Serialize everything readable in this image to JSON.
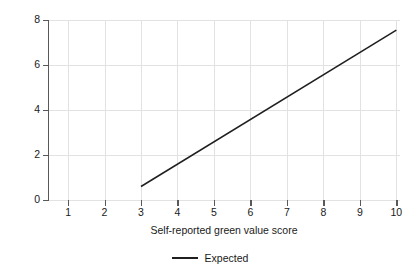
{
  "chart_data": {
    "type": "line",
    "title": "",
    "xlabel": "Self-reported green value score",
    "ylabel": "Green actions during last 6 months",
    "xlim": [
      0.45,
      10.1
    ],
    "ylim": [
      0,
      8
    ],
    "xticks": [
      1,
      2,
      3,
      4,
      5,
      6,
      7,
      8,
      9,
      10
    ],
    "yticks": [
      0,
      2,
      4,
      6,
      8
    ],
    "xtick_labels": [
      "1",
      "2",
      "3",
      "4",
      "5",
      "6",
      "7",
      "8",
      "9",
      "10"
    ],
    "ytick_labels": [
      "0",
      "2",
      "4",
      "6",
      "8"
    ],
    "grid": true,
    "legend_position": "bottom-center",
    "series": [
      {
        "name": "Expected",
        "color": "#1f1f1f",
        "linewidth": 1.5,
        "x": [
          3,
          10
        ],
        "values": [
          0.6,
          7.55
        ]
      }
    ]
  },
  "legend": {
    "entries": [
      {
        "label": "Expected"
      }
    ]
  }
}
